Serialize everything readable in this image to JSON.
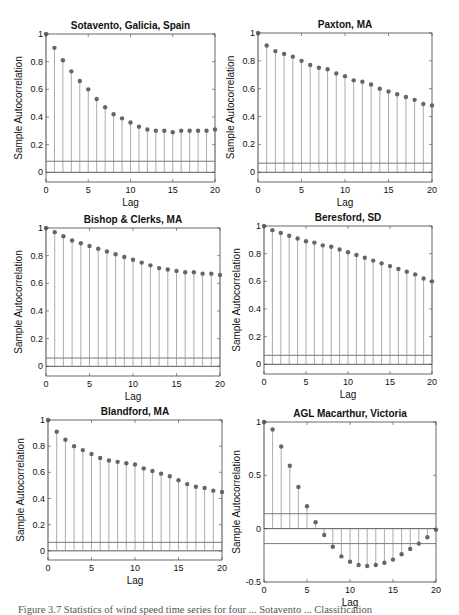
{
  "chart_data": [
    {
      "type": "stem",
      "title": "Sotavento, Galicia, Spain",
      "xlabel": "Lag",
      "ylabel": "Sample Autocorrelation",
      "xlim": [
        0,
        20
      ],
      "ylim": [
        -0.07,
        1
      ],
      "xticks": [
        0,
        5,
        10,
        15,
        20
      ],
      "yticks": [
        0,
        0.2,
        0.4,
        0.6,
        0.8,
        1
      ],
      "ytick_labels": [
        "0",
        "0.2",
        "0.4",
        "0.6",
        "0.8",
        "1"
      ],
      "confidence_bounds": [
        0.08
      ],
      "x": [
        0,
        1,
        2,
        3,
        4,
        5,
        6,
        7,
        8,
        9,
        10,
        11,
        12,
        13,
        14,
        15,
        16,
        17,
        18,
        19,
        20
      ],
      "values": [
        1.0,
        0.9,
        0.81,
        0.73,
        0.66,
        0.6,
        0.53,
        0.47,
        0.42,
        0.39,
        0.36,
        0.33,
        0.31,
        0.3,
        0.3,
        0.29,
        0.3,
        0.3,
        0.3,
        0.3,
        0.31
      ],
      "grid": false
    },
    {
      "type": "stem",
      "title": "Paxton, MA",
      "xlabel": "Lag",
      "ylabel": "Sample Autocorrelation",
      "xlim": [
        0,
        20
      ],
      "ylim": [
        -0.07,
        1
      ],
      "xticks": [
        0,
        5,
        10,
        15,
        20
      ],
      "yticks": [
        0,
        0.2,
        0.4,
        0.6,
        0.8,
        1
      ],
      "ytick_labels": [
        "0",
        "0.2",
        "0.4",
        "0.6",
        "0.8",
        "1"
      ],
      "confidence_bounds": [
        0.065
      ],
      "x": [
        0,
        1,
        2,
        3,
        4,
        5,
        6,
        7,
        8,
        9,
        10,
        11,
        12,
        13,
        14,
        15,
        16,
        17,
        18,
        19,
        20
      ],
      "values": [
        1.0,
        0.91,
        0.87,
        0.85,
        0.83,
        0.8,
        0.77,
        0.75,
        0.74,
        0.71,
        0.69,
        0.66,
        0.65,
        0.63,
        0.6,
        0.58,
        0.56,
        0.54,
        0.52,
        0.49,
        0.48
      ],
      "grid": false
    },
    {
      "type": "stem",
      "title": "Bishop & Clerks, MA",
      "xlabel": "Lag",
      "ylabel": "Sample Autocorrelation",
      "xlim": [
        0,
        20
      ],
      "ylim": [
        -0.07,
        1
      ],
      "xticks": [
        0,
        5,
        10,
        15,
        20
      ],
      "yticks": [
        0,
        0.2,
        0.4,
        0.6,
        0.8,
        1
      ],
      "ytick_labels": [
        "0",
        "0.2",
        "0.4",
        "0.6",
        "0.8",
        "1"
      ],
      "confidence_bounds": [
        0.06
      ],
      "x": [
        0,
        1,
        2,
        3,
        4,
        5,
        6,
        7,
        8,
        9,
        10,
        11,
        12,
        13,
        14,
        15,
        16,
        17,
        18,
        19,
        20
      ],
      "values": [
        1.0,
        0.97,
        0.94,
        0.91,
        0.89,
        0.87,
        0.85,
        0.83,
        0.81,
        0.79,
        0.77,
        0.75,
        0.73,
        0.71,
        0.7,
        0.69,
        0.68,
        0.68,
        0.67,
        0.67,
        0.66
      ],
      "grid": false
    },
    {
      "type": "stem",
      "title": "Beresford, SD",
      "xlabel": "Lag",
      "ylabel": "Sample Autocorrelation",
      "xlim": [
        0,
        20
      ],
      "ylim": [
        -0.07,
        1
      ],
      "xticks": [
        0,
        5,
        10,
        15,
        20
      ],
      "yticks": [
        0,
        0.2,
        0.4,
        0.6,
        0.8,
        1
      ],
      "ytick_labels": [
        "0",
        "0.2",
        "0.4",
        "0.6",
        "0.8",
        "1"
      ],
      "confidence_bounds": [
        0.065
      ],
      "x": [
        0,
        1,
        2,
        3,
        4,
        5,
        6,
        7,
        8,
        9,
        10,
        11,
        12,
        13,
        14,
        15,
        16,
        17,
        18,
        19,
        20
      ],
      "values": [
        1.0,
        0.97,
        0.95,
        0.93,
        0.91,
        0.89,
        0.88,
        0.86,
        0.85,
        0.83,
        0.81,
        0.79,
        0.77,
        0.75,
        0.73,
        0.71,
        0.69,
        0.67,
        0.65,
        0.62,
        0.6
      ],
      "grid": false
    },
    {
      "type": "stem",
      "title": "Blandford, MA",
      "xlabel": "Lag",
      "ylabel": "Sample Autocorrelation",
      "xlim": [
        0,
        20
      ],
      "ylim": [
        -0.07,
        1
      ],
      "xticks": [
        0,
        5,
        10,
        15,
        20
      ],
      "yticks": [
        0,
        0.2,
        0.4,
        0.6,
        0.8,
        1
      ],
      "ytick_labels": [
        "0",
        "0.2",
        "0.4",
        "0.6",
        "0.8",
        "1"
      ],
      "confidence_bounds": [
        0.065
      ],
      "x": [
        0,
        1,
        2,
        3,
        4,
        5,
        6,
        7,
        8,
        9,
        10,
        11,
        12,
        13,
        14,
        15,
        16,
        17,
        18,
        19,
        20
      ],
      "values": [
        1.0,
        0.91,
        0.85,
        0.8,
        0.77,
        0.74,
        0.71,
        0.69,
        0.68,
        0.67,
        0.66,
        0.63,
        0.61,
        0.59,
        0.57,
        0.54,
        0.51,
        0.49,
        0.48,
        0.46,
        0.45
      ],
      "grid": false
    },
    {
      "type": "stem",
      "title": "AGL Macarthur, Victoria",
      "xlabel": "Lag",
      "ylabel": "Sample Autocorrelation",
      "xlim": [
        0,
        20
      ],
      "ylim": [
        -0.5,
        1
      ],
      "xticks": [
        0,
        5,
        10,
        15,
        20
      ],
      "yticks": [
        -0.5,
        0,
        0.5,
        1
      ],
      "ytick_labels": [
        "-0.5",
        "0",
        "0.5",
        "1"
      ],
      "confidence_bounds": [
        0.14,
        -0.14
      ],
      "x": [
        0,
        1,
        2,
        3,
        4,
        5,
        6,
        7,
        8,
        9,
        10,
        11,
        12,
        13,
        14,
        15,
        16,
        17,
        18,
        19,
        20
      ],
      "values": [
        1.0,
        0.93,
        0.77,
        0.59,
        0.39,
        0.21,
        0.06,
        -0.06,
        -0.17,
        -0.26,
        -0.31,
        -0.34,
        -0.35,
        -0.34,
        -0.32,
        -0.29,
        -0.24,
        -0.19,
        -0.14,
        -0.08,
        -0.01
      ],
      "grid": false
    }
  ],
  "panels": [
    {
      "title": "Sotavento, Galicia, Spain"
    },
    {
      "title": "Paxton, MA"
    },
    {
      "title": "Bishop & Clerks, MA"
    },
    {
      "title": "Beresford, SD"
    },
    {
      "title": "Blandford, MA"
    },
    {
      "title": "AGL Macarthur, Victoria"
    }
  ],
  "caption": "Figure 3.7 Statistics of wind speed time series for four ... Sotavento ... Classification",
  "colors": {
    "stem": "#888888",
    "marker": "#666666",
    "axis": "#444444",
    "bound": "#555555",
    "text": "#111111"
  }
}
